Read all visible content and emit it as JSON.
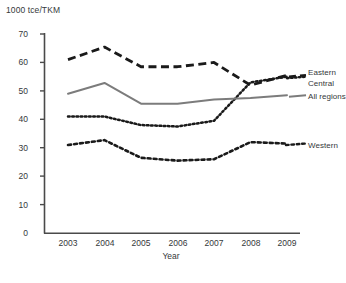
{
  "chart_data": {
    "type": "line",
    "title": "",
    "unit_label": "1000 tce/TKM",
    "xlabel": "Year",
    "ylabel": "",
    "categories": [
      "2003",
      "2004",
      "2005",
      "2006",
      "2007",
      "2008",
      "2009"
    ],
    "x": [
      2003,
      2004,
      2005,
      2006,
      2007,
      2008,
      2009
    ],
    "xlim": [
      2002.5,
      2009.6
    ],
    "ylim": [
      0,
      70
    ],
    "yticks": [
      0,
      10,
      20,
      30,
      40,
      50,
      60,
      70
    ],
    "xticks": [
      "2003",
      "2004",
      "2005",
      "2006",
      "2007",
      "2008",
      "2009"
    ],
    "grid": false,
    "legend_position": "right-inline",
    "series": [
      {
        "name": "Eastern",
        "style": "long-dashed",
        "color": "#1a1a1a",
        "values": [
          61,
          65.4,
          58.5,
          58.5,
          60,
          52,
          55.5
        ]
      },
      {
        "name": "Central",
        "style": "fine-dotted",
        "color": "#1a1a1a",
        "values": [
          41,
          41,
          38,
          37.5,
          39.5,
          53,
          55
        ]
      },
      {
        "name": "All regions",
        "style": "solid",
        "color": "#7c7c7c",
        "values": [
          49,
          52.8,
          45.5,
          45.5,
          47,
          47.5,
          48.5
        ]
      },
      {
        "name": "Western",
        "style": "dashed",
        "color": "#1a1a1a",
        "values": [
          31,
          32.7,
          26.5,
          25.5,
          26,
          32,
          31.5
        ]
      }
    ]
  },
  "axes": {
    "y_tick_labels": [
      "70",
      "60",
      "50",
      "40",
      "30",
      "20",
      "10",
      "0"
    ],
    "x_tick_labels": [
      "2003",
      "2004",
      "2005",
      "2006",
      "2007",
      "2008",
      "2009"
    ]
  },
  "labels": {
    "unit": "1000 tce/TKM",
    "xaxis_title": "Year",
    "legend": {
      "eastern": "Eastern",
      "central": "Central",
      "all_regions": "All regions",
      "western": "Western"
    }
  }
}
